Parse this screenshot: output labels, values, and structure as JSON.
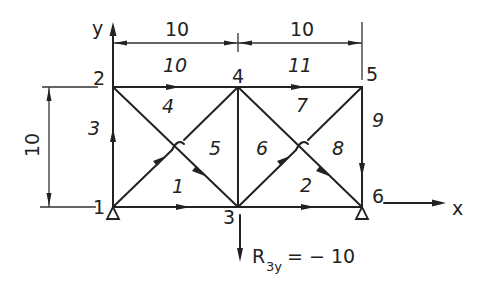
{
  "diagram": {
    "title": "",
    "axes": {
      "x_label": "x",
      "y_label": "y"
    },
    "nodes": [
      {
        "id": "1",
        "label": "1",
        "x": 113,
        "y": 207
      },
      {
        "id": "2",
        "label": "2",
        "x": 113,
        "y": 87
      },
      {
        "id": "3",
        "label": "3",
        "x": 238,
        "y": 207
      },
      {
        "id": "4",
        "label": "4",
        "x": 238,
        "y": 87
      },
      {
        "id": "5",
        "label": "5",
        "x": 362,
        "y": 87
      },
      {
        "id": "6",
        "label": "6",
        "x": 362,
        "y": 207
      }
    ],
    "members": [
      {
        "id": "1",
        "label": "1",
        "from": "1",
        "to": "3"
      },
      {
        "id": "2",
        "label": "2",
        "from": "3",
        "to": "6"
      },
      {
        "id": "3",
        "label": "3",
        "from": "1",
        "to": "2"
      },
      {
        "id": "4",
        "label": "4",
        "from": "1",
        "to": "4"
      },
      {
        "id": "5",
        "label": "5",
        "from": "2",
        "to": "3"
      },
      {
        "id": "6",
        "label": "6",
        "from": "3",
        "to": "4"
      },
      {
        "id": "7",
        "label": "7",
        "from": "3",
        "to": "5"
      },
      {
        "id": "8",
        "label": "8",
        "from": "4",
        "to": "6"
      },
      {
        "id": "9",
        "label": "9",
        "from": "5",
        "to": "6"
      },
      {
        "id": "10",
        "label": "10",
        "from": "2",
        "to": "4"
      },
      {
        "id": "11",
        "label": "11",
        "from": "4",
        "to": "5"
      }
    ],
    "dimensions": {
      "top_left": "10",
      "top_right": "10",
      "left_height": "10"
    },
    "supports": [
      {
        "node": "1",
        "type": "pin"
      },
      {
        "node": "6",
        "type": "pin"
      }
    ],
    "reaction": {
      "node": "3",
      "symbol": "R",
      "subscript": "3y",
      "value_text": "= − 10"
    },
    "colors": {
      "ink": "#222222",
      "background": "#ffffff"
    }
  }
}
